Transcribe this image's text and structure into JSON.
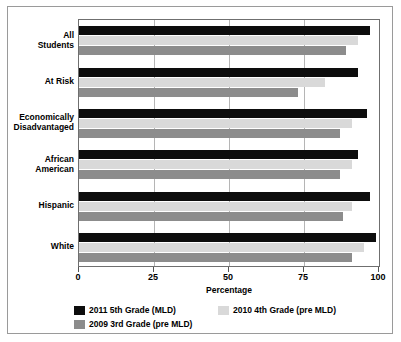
{
  "chart_data": {
    "type": "bar",
    "orientation": "horizontal",
    "title": "",
    "xlabel": "Percentage",
    "ylabel": "",
    "xlim": [
      0,
      100
    ],
    "xticks": [
      0,
      25,
      50,
      75,
      100
    ],
    "grid": true,
    "legend_position": "bottom",
    "categories": [
      "All\nStudents",
      "At Risk",
      "Economically\nDisadvantaged",
      "African\nAmerican",
      "Hispanic",
      "White"
    ],
    "series": [
      {
        "name": "2011 5th Grade (MLD)",
        "color": "#0d0d0d",
        "values": [
          97,
          93,
          96,
          93,
          97,
          99
        ]
      },
      {
        "name": "2010 4th Grade (pre MLD)",
        "color": "#d9d9d9",
        "values": [
          93,
          82,
          91,
          91,
          91,
          95
        ]
      },
      {
        "name": "2009 3rd Grade (pre MLD)",
        "color": "#8c8c8c",
        "values": [
          89,
          73,
          87,
          87,
          88,
          91
        ]
      }
    ]
  },
  "axis": {
    "x_title": "Percentage",
    "tick_labels": [
      "0",
      "25",
      "50",
      "75",
      "100"
    ]
  },
  "legend": {
    "entries": [
      {
        "label": "2011 5th Grade (MLD)",
        "color": "#0d0d0d"
      },
      {
        "label": "2010 4th Grade (pre MLD)",
        "color": "#d9d9d9"
      },
      {
        "label": "2009 3rd Grade (pre MLD)",
        "color": "#8c8c8c"
      }
    ]
  }
}
